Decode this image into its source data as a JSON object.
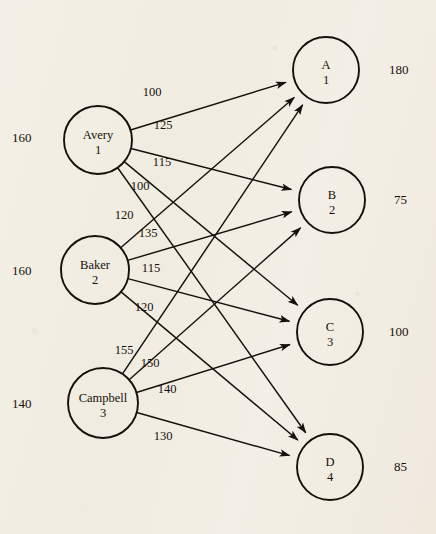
{
  "diagram": {
    "type": "bipartite-network",
    "background_color": "#f3eee4",
    "ink_color": "#14110c"
  },
  "sources": [
    {
      "id": "avery",
      "name": "Avery",
      "index": "1",
      "supply": "160",
      "cx": 98,
      "cy": 140,
      "r": 34
    },
    {
      "id": "baker",
      "name": "Baker",
      "index": "2",
      "supply": "160",
      "cx": 95,
      "cy": 270,
      "r": 34
    },
    {
      "id": "campbell",
      "name": "Campbell",
      "index": "3",
      "supply": "140",
      "cx": 103,
      "cy": 403,
      "r": 35
    }
  ],
  "destinations": [
    {
      "id": "a",
      "name": "A",
      "index": "1",
      "demand": "180",
      "cx": 326,
      "cy": 70,
      "r": 33
    },
    {
      "id": "b",
      "name": "B",
      "index": "2",
      "demand": "75",
      "cx": 332,
      "cy": 200,
      "r": 33
    },
    {
      "id": "c",
      "name": "C",
      "index": "3",
      "demand": "100",
      "cx": 330,
      "cy": 332,
      "r": 33
    },
    {
      "id": "d",
      "name": "D",
      "index": "4",
      "demand": "85",
      "cx": 330,
      "cy": 467,
      "r": 33
    }
  ],
  "edges": [
    {
      "from": "avery",
      "to": "a",
      "cost": "100",
      "lx": 152,
      "ly": 96
    },
    {
      "from": "avery",
      "to": "b",
      "cost": "125",
      "lx": 163,
      "ly": 129
    },
    {
      "from": "avery",
      "to": "c",
      "cost": "115",
      "lx": 162,
      "ly": 166
    },
    {
      "from": "avery",
      "to": "d",
      "cost": "100",
      "lx": 140,
      "ly": 190
    },
    {
      "from": "baker",
      "to": "a",
      "cost": "120",
      "lx": 124,
      "ly": 219
    },
    {
      "from": "baker",
      "to": "b",
      "cost": "135",
      "lx": 148,
      "ly": 237
    },
    {
      "from": "baker",
      "to": "c",
      "cost": "115",
      "lx": 151,
      "ly": 272
    },
    {
      "from": "baker",
      "to": "d",
      "cost": "120",
      "lx": 144,
      "ly": 311
    },
    {
      "from": "campbell",
      "to": "a",
      "cost": "155",
      "lx": 124,
      "ly": 354
    },
    {
      "from": "campbell",
      "to": "b",
      "cost": "150",
      "lx": 150,
      "ly": 367
    },
    {
      "from": "campbell",
      "to": "c",
      "cost": "140",
      "lx": 167,
      "ly": 393
    },
    {
      "from": "campbell",
      "to": "d",
      "cost": "130",
      "lx": 163,
      "ly": 440
    }
  ],
  "supply_labels": [
    {
      "value": "160",
      "x": 12,
      "y": 142
    },
    {
      "value": "160",
      "x": 12,
      "y": 275
    },
    {
      "value": "140",
      "x": 12,
      "y": 408
    }
  ],
  "demand_labels": [
    {
      "value": "180",
      "x": 389,
      "y": 74
    },
    {
      "value": "75",
      "x": 394,
      "y": 204
    },
    {
      "value": "100",
      "x": 389,
      "y": 336
    },
    {
      "value": "85",
      "x": 394,
      "y": 471
    }
  ],
  "chart_data": {
    "type": "table",
    "row_header": "Source",
    "col_header": "Destination",
    "rows": [
      "Avery 1",
      "Baker 2",
      "Campbell 3"
    ],
    "columns": [
      "A 1",
      "B 2",
      "C 3",
      "D 4"
    ],
    "supplies": [
      160,
      160,
      140
    ],
    "demands": [
      180,
      75,
      100,
      85
    ],
    "costs": [
      [
        100,
        125,
        115,
        100
      ],
      [
        120,
        135,
        115,
        120
      ],
      [
        155,
        150,
        140,
        130
      ]
    ]
  }
}
